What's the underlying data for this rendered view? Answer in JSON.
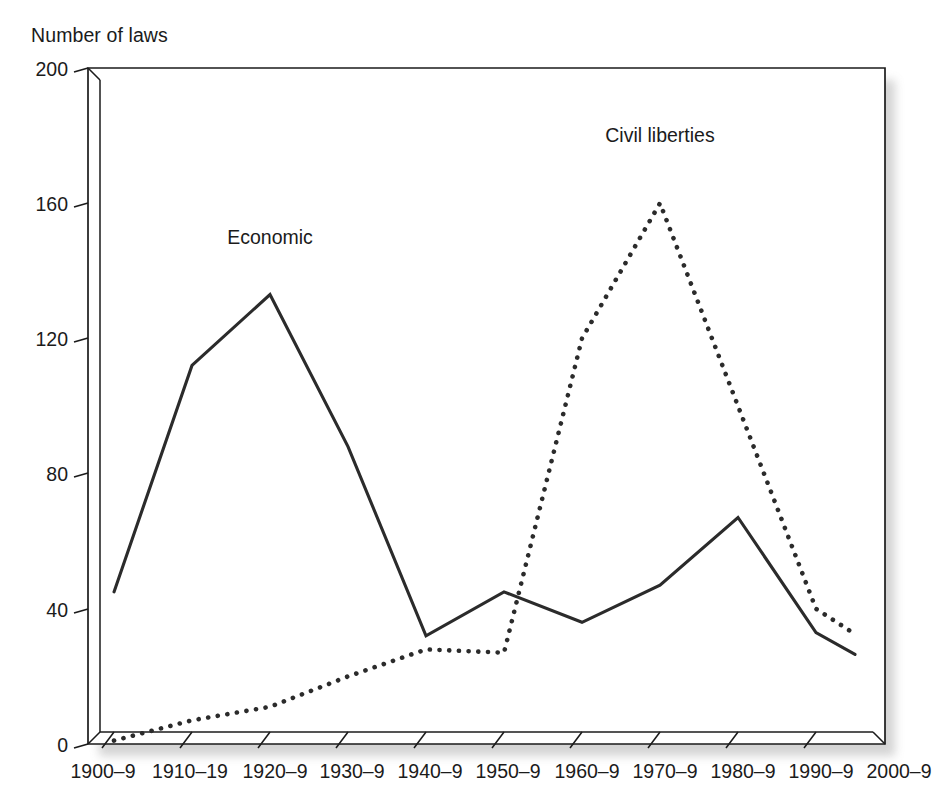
{
  "chart_data": {
    "type": "line",
    "title": "",
    "ylabel": "Number of laws",
    "xlabel": "",
    "ylim": [
      0,
      200
    ],
    "yticks": [
      0,
      40,
      80,
      120,
      160,
      200
    ],
    "ytick_labels": [
      "0",
      "40",
      "80",
      "120",
      "160",
      "200"
    ],
    "grid": false,
    "legend_position": "inline-annotations",
    "categories": [
      "1900–9",
      "1910–19",
      "1920–9",
      "1930–9",
      "1940–9",
      "1950–9",
      "1960–9",
      "1970–9",
      "1980–9",
      "1990–9",
      "2000–9"
    ],
    "series": [
      {
        "name": "Economic",
        "style": "solid",
        "color": "#2b2b2b",
        "values": [
          45,
          112,
          133,
          88,
          32,
          45,
          36,
          47,
          67,
          33,
          20
        ],
        "partial_last_segment": true,
        "annotation": {
          "text": "Economic",
          "category": "1920–9",
          "value": 148
        }
      },
      {
        "name": "Civil liberties",
        "style": "dotted",
        "color": "#2b2b2b",
        "values": [
          1,
          7,
          11,
          20,
          28,
          27,
          120,
          160,
          100,
          40,
          25
        ],
        "partial_last_segment": true,
        "annotation": {
          "text": "Civil liberties",
          "category": "1970–9",
          "value": 178
        }
      }
    ]
  },
  "axes": {
    "y_title": "Number of laws",
    "y_tick_labels": [
      "200",
      "160",
      "120",
      "80",
      "40",
      "0"
    ],
    "x_tick_labels": [
      "1900–9",
      "1910–19",
      "1920–9",
      "1930–9",
      "1940–9",
      "1950–9",
      "1960–9",
      "1970–9",
      "1980–9",
      "1990–9",
      "2000–9"
    ]
  },
  "annotations": {
    "economic": "Economic",
    "civil_liberties": "Civil liberties"
  },
  "colors": {
    "ink": "#1b1b1b",
    "series": "#2b2b2b",
    "background": "#ffffff"
  }
}
